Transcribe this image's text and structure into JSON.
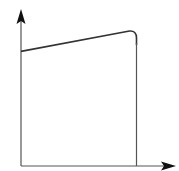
{
  "diagram": {
    "type": "function-sketch",
    "axes": {
      "x_label": "",
      "y_label": "",
      "arrows": true
    },
    "curve": {
      "shape": "linear-rise-then-sharp-drop",
      "start_level": 0.73,
      "peak_level": 0.86,
      "cutoff_fraction_of_x": 0.75
    },
    "colors": {
      "line": "#333333",
      "axis": "#555555",
      "arrowhead": "#111111",
      "background": "#ffffff"
    }
  }
}
